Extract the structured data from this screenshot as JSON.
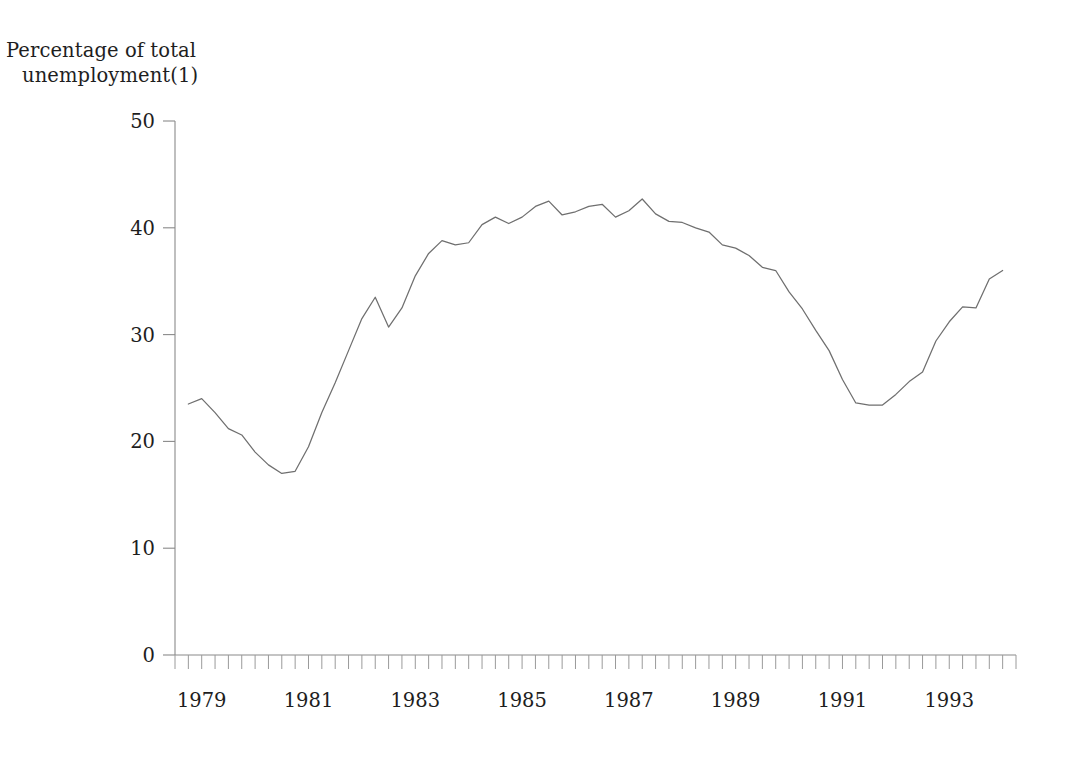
{
  "chart_data": {
    "type": "line",
    "title": "",
    "ylabel": "Percentage of total unemployment(1)",
    "ylabel_line1": "Percentage of total",
    "ylabel_line2": "unemployment(1)",
    "xlabel": "",
    "ylim": [
      0,
      50
    ],
    "yticks": [
      0,
      10,
      20,
      30,
      40,
      50
    ],
    "ytick_labels": [
      "0",
      "10",
      "20",
      "30",
      "40",
      "50"
    ],
    "xlim": [
      1978.5,
      1994.25
    ],
    "xticks": [
      1979,
      1981,
      1983,
      1985,
      1987,
      1989,
      1991,
      1993
    ],
    "xtick_labels": [
      "1979",
      "1981",
      "1983",
      "1985",
      "1987",
      "1989",
      "1991",
      "1993"
    ],
    "x_minor_tick_interval_years": 0.25,
    "grid": false,
    "legend": "none",
    "line_color": "#6f6f6f",
    "series": [
      {
        "name": "Percentage of total unemployment",
        "x": [
          1978.75,
          1979.0,
          1979.25,
          1979.5,
          1979.75,
          1980.0,
          1980.25,
          1980.5,
          1980.75,
          1981.0,
          1981.25,
          1981.5,
          1981.75,
          1982.0,
          1982.25,
          1982.5,
          1982.75,
          1983.0,
          1983.25,
          1983.5,
          1983.75,
          1984.0,
          1984.25,
          1984.5,
          1984.75,
          1985.0,
          1985.25,
          1985.5,
          1985.75,
          1986.0,
          1986.25,
          1986.5,
          1986.75,
          1987.0,
          1987.25,
          1987.5,
          1987.75,
          1988.0,
          1988.25,
          1988.5,
          1988.75,
          1989.0,
          1989.25,
          1989.5,
          1989.75,
          1990.0,
          1990.25,
          1990.5,
          1990.75,
          1991.0,
          1991.25,
          1991.5,
          1991.75,
          1992.0,
          1992.25,
          1992.5,
          1992.75,
          1993.0,
          1993.25,
          1993.5,
          1993.75,
          1994.0
        ],
        "values": [
          23.5,
          24.0,
          22.7,
          21.2,
          20.6,
          19.0,
          17.8,
          17.0,
          17.2,
          19.5,
          22.7,
          25.5,
          28.5,
          31.5,
          33.5,
          30.7,
          32.5,
          35.5,
          37.6,
          38.8,
          38.4,
          38.6,
          40.3,
          41.0,
          40.4,
          41.0,
          42.0,
          42.5,
          41.2,
          41.5,
          42.0,
          42.2,
          41.0,
          41.6,
          42.7,
          41.3,
          40.6,
          40.5,
          40.0,
          39.6,
          38.4,
          38.1,
          37.4,
          36.3,
          36.0,
          34.0,
          32.4,
          30.4,
          28.5,
          25.8,
          23.6,
          23.4,
          23.4,
          24.4,
          25.6,
          26.5,
          29.4,
          31.2,
          32.6,
          32.5,
          35.2,
          36.0
        ]
      }
    ],
    "notes": {
      "min_value": 17.0,
      "min_year": 1980.5,
      "max_value": 42.7,
      "max_year": 1987.25,
      "secondary_trough_value": 23.4,
      "secondary_trough_year": 1991.5,
      "final_value": 37.0
    }
  }
}
